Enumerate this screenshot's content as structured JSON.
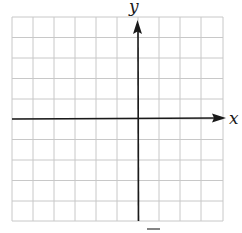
{
  "figure": {
    "type": "coordinate-grid",
    "grid": {
      "columns": 10,
      "rows": 10,
      "line_color": "#c8c8c8"
    },
    "axes": {
      "x_label": "x",
      "y_label": "y",
      "color": "#1a1a1a",
      "x_axis_row": 5,
      "y_axis_column": 6
    },
    "bottom_partial_mark": "–"
  }
}
